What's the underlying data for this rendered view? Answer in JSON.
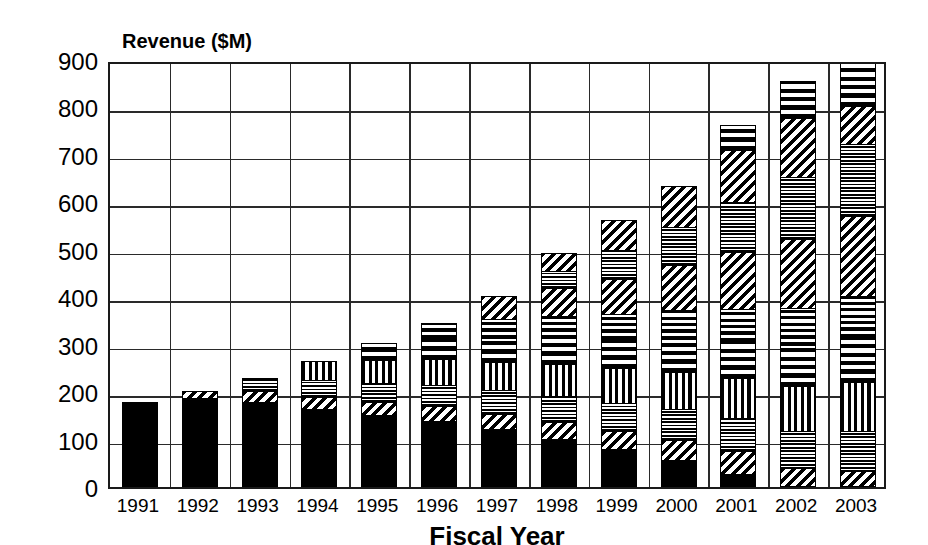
{
  "chart_data": {
    "type": "bar",
    "subtype": "stacked-bar",
    "title": "",
    "xlabel": "Fiscal Year",
    "ylabel": "Revenue ($M)",
    "ylim": [
      0,
      900
    ],
    "ytick_labels": [
      "900",
      "800",
      "700",
      "600",
      "500",
      "400",
      "300",
      "200",
      "100",
      "0"
    ],
    "ytick_values": [
      900,
      800,
      700,
      600,
      500,
      400,
      300,
      200,
      100,
      0
    ],
    "ytick_step": 100,
    "grid": true,
    "legend": "none",
    "categories": [
      "1991",
      "1992",
      "1993",
      "1994",
      "1995",
      "1996",
      "1997",
      "1998",
      "1999",
      "2000",
      "2001",
      "2002",
      "2003"
    ],
    "series": [
      {
        "name": "segment-1",
        "pattern": "solid-black",
        "values": [
          180,
          185,
          178,
          163,
          150,
          138,
          120,
          100,
          78,
          55,
          25,
          0,
          0
        ]
      },
      {
        "name": "segment-2",
        "pattern": "diagonal-stripes",
        "values": [
          0,
          18,
          22,
          25,
          28,
          30,
          32,
          35,
          38,
          42,
          48,
          35,
          30
        ]
      },
      {
        "name": "segment-3",
        "pattern": "fine-dots",
        "values": [
          0,
          0,
          30,
          35,
          40,
          45,
          50,
          55,
          60,
          65,
          70,
          80,
          85
        ]
      },
      {
        "name": "segment-4",
        "pattern": "vertical-stripes",
        "values": [
          0,
          0,
          0,
          42,
          48,
          55,
          60,
          68,
          72,
          78,
          85,
          95,
          105
        ]
      },
      {
        "name": "segment-5",
        "pattern": "checkerboard",
        "values": [
          0,
          0,
          0,
          0,
          38,
          45,
          50,
          55,
          62,
          70,
          78,
          88,
          95
        ]
      },
      {
        "name": "segment-6",
        "pattern": "horizontal-lines",
        "values": [
          0,
          0,
          0,
          0,
          0,
          32,
          40,
          45,
          52,
          60,
          68,
          78,
          85
        ]
      },
      {
        "name": "segment-7",
        "pattern": "diagonal-stripes-2",
        "values": [
          0,
          0,
          0,
          0,
          0,
          0,
          50,
          60,
          75,
          95,
          120,
          145,
          170
        ]
      },
      {
        "name": "segment-8",
        "pattern": "fine-dots-2",
        "values": [
          0,
          0,
          0,
          0,
          0,
          0,
          0,
          35,
          60,
          80,
          105,
          130,
          150
        ]
      },
      {
        "name": "segment-9",
        "pattern": "diagonal-stripes-3",
        "values": [
          0,
          0,
          0,
          0,
          0,
          0,
          0,
          40,
          65,
          90,
          110,
          125,
          80
        ]
      },
      {
        "name": "segment-10",
        "pattern": "checkerboard-2",
        "values": [
          0,
          0,
          0,
          0,
          0,
          0,
          0,
          0,
          0,
          0,
          55,
          80,
          95
        ]
      },
      {
        "name": "segment-11",
        "pattern": "horizontal-lines-2",
        "values": [
          0,
          0,
          0,
          0,
          0,
          0,
          0,
          0,
          0,
          0,
          0,
          0,
          70
        ]
      }
    ],
    "totals": [
      180,
      203,
      230,
      265,
      304,
      345,
      402,
      443,
      512,
      585,
      664,
      756,
      865
    ]
  },
  "axis": {
    "y_title": "Revenue ($M)",
    "x_title": "Fiscal Year"
  },
  "colors": {
    "ink": "#000000",
    "grid": "#2a2a2a",
    "background": "#ffffff"
  }
}
